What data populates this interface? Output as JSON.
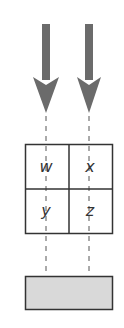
{
  "diagram": {
    "arrows": [
      {
        "name": "left-arrow",
        "direction": "down",
        "color": "#6b6b6b"
      },
      {
        "name": "right-arrow",
        "direction": "down",
        "color": "#6b6b6b"
      }
    ],
    "grid": {
      "cells": [
        {
          "label": "w",
          "row": 0,
          "col": 0
        },
        {
          "label": "x",
          "row": 0,
          "col": 1
        },
        {
          "label": "y",
          "row": 1,
          "col": 0
        },
        {
          "label": "z",
          "row": 1,
          "col": 1
        }
      ],
      "border_color": "#333333"
    },
    "base_block": {
      "fill": "#d9d9d9",
      "border_color": "#333333"
    },
    "guide_lines": {
      "style": "dashed",
      "color": "#555555"
    }
  }
}
